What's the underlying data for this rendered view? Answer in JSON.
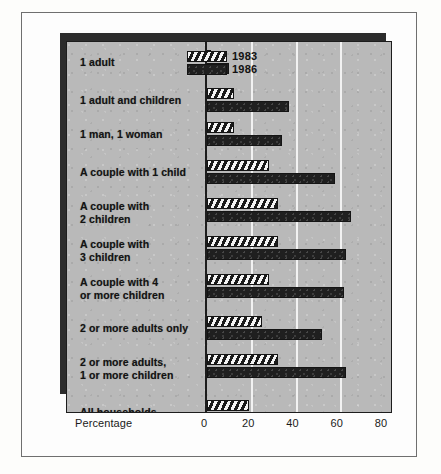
{
  "chart_data": {
    "type": "bar",
    "orientation": "horizontal",
    "title": "",
    "xlabel": "Percentage",
    "ylabel": "",
    "xlim": [
      0,
      80
    ],
    "xticks": [
      0,
      20,
      40,
      60,
      80
    ],
    "gridlines": [
      20,
      40,
      60
    ],
    "grid": true,
    "legend_position": "top-right",
    "categories": [
      "1 adult",
      "1 adult and children",
      "1 man, 1 woman",
      "A couple with 1 child",
      "A couple with\n2 children",
      "A couple with\n3 children",
      "A couple with 4\nor more children",
      "2 or more adults only",
      "2 or more adults,\n1 or more children",
      "All households"
    ],
    "series": [
      {
        "name": "1983",
        "pattern": "hatched",
        "values": [
          2,
          12,
          12,
          28,
          32,
          32,
          28,
          25,
          32,
          19
        ]
      },
      {
        "name": "1986",
        "pattern": "solid",
        "values": [
          10,
          37,
          34,
          58,
          65,
          63,
          62,
          52,
          63,
          38
        ]
      }
    ]
  },
  "legend": {
    "items": [
      {
        "label": "1983",
        "swatch": "hatched-swatch"
      },
      {
        "label": "1986",
        "swatch": "solid-swatch"
      }
    ]
  },
  "axis": {
    "title": "Percentage",
    "ticks": [
      "0",
      "20",
      "40",
      "60",
      "80"
    ]
  },
  "rows": [
    {
      "label_line1": "1 adult",
      "label_line2": ""
    },
    {
      "label_line1": "1 adult and children",
      "label_line2": ""
    },
    {
      "label_line1": "1 man, 1 woman",
      "label_line2": ""
    },
    {
      "label_line1": "A couple with 1 child",
      "label_line2": ""
    },
    {
      "label_line1": "A couple with",
      "label_line2": "2 children"
    },
    {
      "label_line1": "A couple with",
      "label_line2": "3 children"
    },
    {
      "label_line1": "A couple with 4",
      "label_line2": "or more children"
    },
    {
      "label_line1": "2 or more adults only",
      "label_line2": ""
    },
    {
      "label_line1": "2 or more adults,",
      "label_line2": "1 or more children"
    },
    {
      "label_line1": "All households",
      "label_line2": ""
    }
  ],
  "colors": {
    "panel_background": "#b9b9b9",
    "bar_dark": "#1f1f1f",
    "hatch_light": "#f4f4f4",
    "gridline": "#f2f2f2",
    "page_background": "#fdfdfd"
  }
}
